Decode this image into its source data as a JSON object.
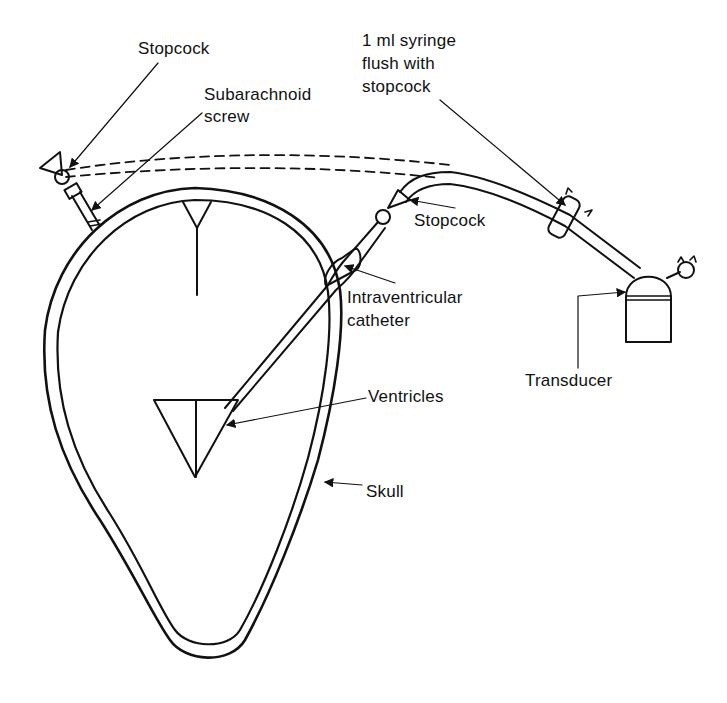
{
  "diagram": {
    "labels": {
      "stopcock_top": "Stopcock",
      "subarachnoid_line1": "Subarachnoid",
      "subarachnoid_line2": "screw",
      "syringe_line1": "1 ml syringe",
      "syringe_line2": "flush with",
      "syringe_line3": "stopcock",
      "stopcock_mid": "Stopcock",
      "catheter_line1": "Intraventricular",
      "catheter_line2": "catheter",
      "transducer": "Transducer",
      "ventricles": "Ventricles",
      "skull": "Skull"
    },
    "colors": {
      "ink": "#111111",
      "background": "#ffffff"
    }
  }
}
